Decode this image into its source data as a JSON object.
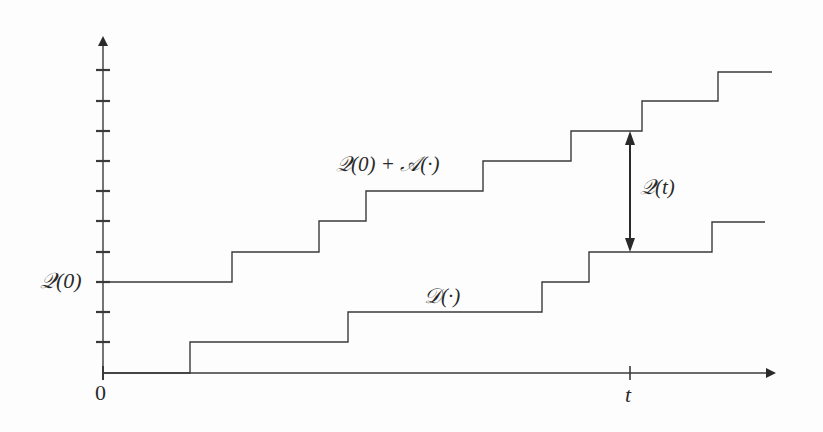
{
  "diagram": {
    "type": "step-function queue diagram",
    "colors": {
      "line": "#3a3a3a",
      "text": "#2a2a2a",
      "background": "#fdfdfd"
    },
    "labels": {
      "y_q0": "𝒬(0)",
      "origin": "0",
      "x_t": "t",
      "arrivals": "𝒬(0) + 𝒜(·)",
      "departures": "𝒟(·)",
      "queue_t": "𝒬(t)"
    },
    "axes": {
      "origin": [
        103,
        373
      ],
      "y_axis_top": 28,
      "x_axis_right": 782,
      "y_ticks": [
        342,
        312,
        282,
        252,
        221,
        191,
        161,
        131,
        101,
        70
      ],
      "t_tick_x": 630
    },
    "arrivals_curve": {
      "name": "Q(0)+A(·)",
      "points": [
        [
          103,
          282
        ],
        [
          232,
          282
        ],
        [
          232,
          252
        ],
        [
          319,
          252
        ],
        [
          319,
          221
        ],
        [
          366,
          221
        ],
        [
          366,
          191
        ],
        [
          483,
          191
        ],
        [
          483,
          161
        ],
        [
          571,
          161
        ],
        [
          571,
          131
        ],
        [
          642,
          131
        ],
        [
          642,
          101
        ],
        [
          718,
          101
        ],
        [
          718,
          72
        ],
        [
          772,
          72
        ]
      ]
    },
    "departures_curve": {
      "name": "D(·)",
      "points": [
        [
          103,
          373
        ],
        [
          190,
          373
        ],
        [
          190,
          342
        ],
        [
          348,
          342
        ],
        [
          348,
          312
        ],
        [
          542,
          312
        ],
        [
          542,
          282
        ],
        [
          589,
          282
        ],
        [
          589,
          252
        ],
        [
          712,
          252
        ],
        [
          712,
          222
        ],
        [
          765,
          222
        ]
      ]
    },
    "queue_arrow": {
      "x": 630,
      "y_top": 131,
      "y_bottom": 252
    }
  }
}
